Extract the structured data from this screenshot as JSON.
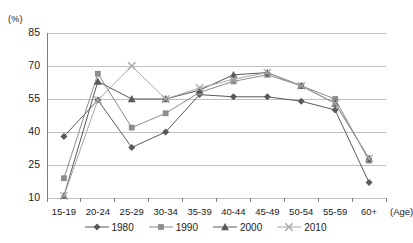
{
  "chart_data": {
    "type": "line",
    "title": "",
    "xlabel": "(Age)",
    "ylabel": "(%)",
    "ylim": [
      10,
      85
    ],
    "yticks": [
      10,
      25,
      40,
      55,
      70,
      85
    ],
    "grid": true,
    "legend_position": "bottom",
    "categories": [
      "15-19",
      "20-24",
      "25-29",
      "30-34",
      "35-39",
      "40-44",
      "45-49",
      "50-54",
      "55-59",
      "60+"
    ],
    "series": [
      {
        "name": "1980",
        "marker": "diamond",
        "color": "#595959",
        "values": [
          38,
          54.5,
          33,
          40,
          57,
          56,
          56,
          54,
          50,
          17
        ]
      },
      {
        "name": "1990",
        "marker": "square",
        "color": "#8c8c8c",
        "values": [
          19,
          66.5,
          42,
          48.5,
          58,
          63,
          66,
          61,
          55,
          27
        ]
      },
      {
        "name": "2000",
        "marker": "triangle",
        "color": "#595959",
        "values": [
          11,
          63,
          55,
          55,
          59,
          66,
          67,
          61,
          53,
          28
        ]
      },
      {
        "name": "2010",
        "marker": "cross",
        "color": "#a6a6a6",
        "values": [
          11,
          54.5,
          70,
          55,
          60,
          64,
          67,
          61,
          53,
          28
        ]
      }
    ]
  },
  "axis": {
    "unit_label": "(%)",
    "age_label": "(Age)",
    "ytick_labels": [
      "85",
      "70",
      "55",
      "40",
      "25",
      "10"
    ],
    "xtick_labels": [
      "15-19",
      "20-24",
      "25-29",
      "30-34",
      "35-39",
      "40-44",
      "45-49",
      "50-54",
      "55-59",
      "60+"
    ]
  },
  "legend": {
    "items": [
      {
        "label": "1980",
        "marker": "diamond"
      },
      {
        "label": "1990",
        "marker": "square"
      },
      {
        "label": "2000",
        "marker": "triangle"
      },
      {
        "label": "2010",
        "marker": "cross"
      }
    ]
  },
  "colors": {
    "grid": "#bfbfbf",
    "axis": "#7f7f7f",
    "s1980": "#595959",
    "s1990": "#8c8c8c",
    "s2000": "#595959",
    "s2010": "#a6a6a6"
  }
}
